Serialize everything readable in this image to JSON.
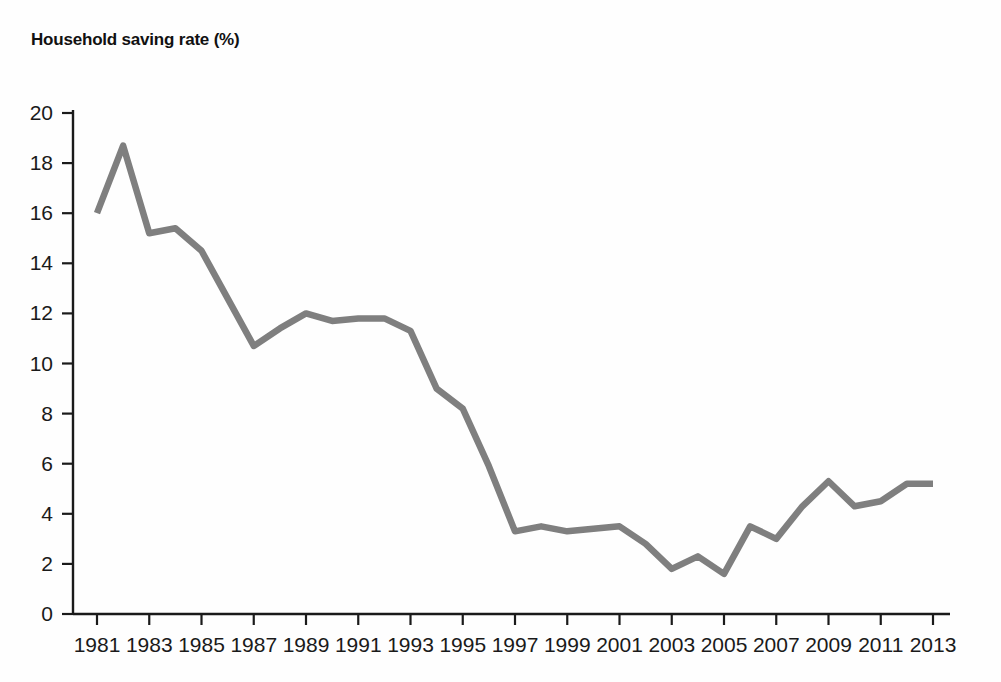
{
  "figure": {
    "title": "Household saving rate (%)",
    "background_color": "#fefefe"
  },
  "chart_data": {
    "type": "line",
    "title": "Household saving rate (%)",
    "xlabel": "",
    "ylabel": "",
    "x": [
      1981,
      1982,
      1983,
      1984,
      1985,
      1986,
      1987,
      1988,
      1989,
      1990,
      1991,
      1992,
      1993,
      1994,
      1995,
      1996,
      1997,
      1998,
      1999,
      2000,
      2001,
      2002,
      2003,
      2004,
      2005,
      2006,
      2007,
      2008,
      2009,
      2010,
      2011,
      2012,
      2013
    ],
    "values": [
      16.0,
      18.7,
      15.2,
      15.4,
      14.5,
      12.6,
      10.7,
      11.4,
      12.0,
      11.7,
      11.8,
      11.8,
      11.3,
      9.0,
      8.2,
      5.9,
      3.3,
      3.5,
      3.3,
      3.4,
      3.5,
      2.8,
      1.8,
      2.3,
      1.6,
      3.5,
      3.0,
      4.3,
      5.3,
      4.3,
      4.5,
      5.2,
      5.2
    ],
    "series": [
      {
        "name": "Household saving rate",
        "color": "#7f7f7f",
        "values": [
          16.0,
          18.7,
          15.2,
          15.4,
          14.5,
          12.6,
          10.7,
          11.4,
          12.0,
          11.7,
          11.8,
          11.8,
          11.3,
          9.0,
          8.2,
          5.9,
          3.3,
          3.5,
          3.3,
          3.4,
          3.5,
          2.8,
          1.8,
          2.3,
          1.6,
          3.5,
          3.0,
          4.3,
          5.3,
          4.3,
          4.5,
          5.2,
          5.2
        ]
      }
    ],
    "ylim": [
      0,
      20
    ],
    "xlim": [
      1981,
      2013
    ],
    "ytick_labels": [
      "0",
      "2",
      "4",
      "6",
      "8",
      "10",
      "12",
      "14",
      "16",
      "18",
      "20"
    ],
    "ytick_values": [
      0,
      2,
      4,
      6,
      8,
      10,
      12,
      14,
      16,
      18,
      20
    ],
    "xtick_labels": [
      "1981",
      "1983",
      "1985",
      "1987",
      "1989",
      "1991",
      "1993",
      "1995",
      "1997",
      "1999",
      "2001",
      "2003",
      "2005",
      "2007",
      "2009",
      "2011",
      "2013"
    ],
    "xtick_values": [
      1981,
      1983,
      1985,
      1987,
      1989,
      1991,
      1993,
      1995,
      1997,
      1999,
      2001,
      2003,
      2005,
      2007,
      2009,
      2011,
      2013
    ],
    "grid": false,
    "legend": false,
    "legend_position": "none",
    "line_color": "#7f7f7f",
    "axis_color": "#1a1a1a"
  }
}
